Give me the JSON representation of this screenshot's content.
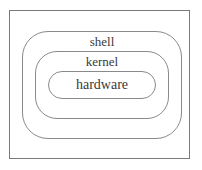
{
  "diagram": {
    "type": "nested-layers",
    "layers": [
      {
        "id": "shell",
        "label": "shell",
        "level": "outer"
      },
      {
        "id": "kernel",
        "label": "kernel",
        "level": "middle"
      },
      {
        "id": "hardware",
        "label": "hardware",
        "level": "inner"
      }
    ],
    "colors": {
      "stroke": "#8a8a8a",
      "frame": "#7a7a7a",
      "text": "#3a3a3a",
      "background": "#ffffff"
    }
  }
}
